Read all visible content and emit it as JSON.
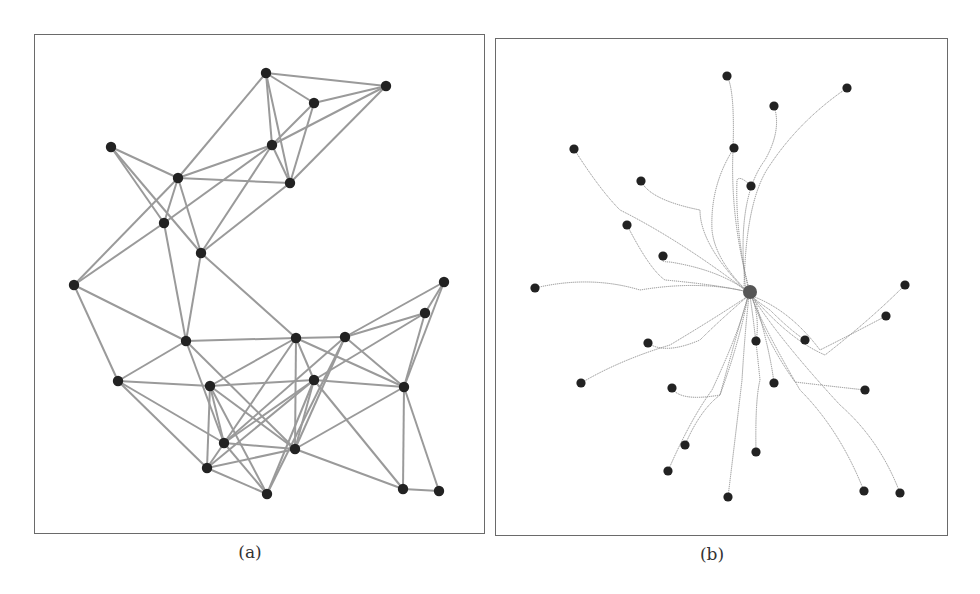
{
  "figure": {
    "panels": [
      {
        "id": "a",
        "caption": "(a)",
        "style": {
          "edge_color": "#9a9a9a",
          "edge_width": 2,
          "node_color": "#222222",
          "node_radius": 5.2
        },
        "nodes": [
          [
            266,
            73
          ],
          [
            386,
            86
          ],
          [
            314,
            103
          ],
          [
            111,
            147
          ],
          [
            272,
            145
          ],
          [
            178,
            178
          ],
          [
            290,
            183
          ],
          [
            164,
            223
          ],
          [
            201,
            253
          ],
          [
            74,
            285
          ],
          [
            444,
            282
          ],
          [
            425,
            313
          ],
          [
            186,
            341
          ],
          [
            296,
            338
          ],
          [
            345,
            337
          ],
          [
            118,
            381
          ],
          [
            210,
            386
          ],
          [
            314,
            380
          ],
          [
            404,
            387
          ],
          [
            224,
            443
          ],
          [
            295,
            449
          ],
          [
            207,
            468
          ],
          [
            267,
            494
          ],
          [
            403,
            489
          ],
          [
            439,
            491
          ]
        ],
        "edges": [
          [
            0,
            1
          ],
          [
            0,
            2
          ],
          [
            0,
            4
          ],
          [
            0,
            6
          ],
          [
            0,
            5
          ],
          [
            2,
            1
          ],
          [
            2,
            4
          ],
          [
            2,
            6
          ],
          [
            1,
            4
          ],
          [
            1,
            6
          ],
          [
            4,
            6
          ],
          [
            3,
            5
          ],
          [
            3,
            7
          ],
          [
            3,
            8
          ],
          [
            5,
            4
          ],
          [
            5,
            6
          ],
          [
            5,
            7
          ],
          [
            5,
            8
          ],
          [
            5,
            9
          ],
          [
            7,
            4
          ],
          [
            7,
            9
          ],
          [
            7,
            12
          ],
          [
            8,
            4
          ],
          [
            8,
            6
          ],
          [
            8,
            12
          ],
          [
            8,
            13
          ],
          [
            9,
            12
          ],
          [
            9,
            15
          ],
          [
            12,
            15
          ],
          [
            12,
            13
          ],
          [
            12,
            19
          ],
          [
            12,
            20
          ],
          [
            15,
            16
          ],
          [
            15,
            19
          ],
          [
            15,
            21
          ],
          [
            16,
            19
          ],
          [
            16,
            21
          ],
          [
            16,
            22
          ],
          [
            16,
            20
          ],
          [
            16,
            17
          ],
          [
            16,
            13
          ],
          [
            19,
            20
          ],
          [
            19,
            17
          ],
          [
            19,
            22
          ],
          [
            19,
            14
          ],
          [
            21,
            17
          ],
          [
            21,
            20
          ],
          [
            21,
            22
          ],
          [
            21,
            13
          ],
          [
            22,
            17
          ],
          [
            22,
            14
          ],
          [
            13,
            14
          ],
          [
            13,
            17
          ],
          [
            13,
            18
          ],
          [
            13,
            20
          ],
          [
            14,
            10
          ],
          [
            14,
            11
          ],
          [
            14,
            18
          ],
          [
            14,
            20
          ],
          [
            17,
            11
          ],
          [
            17,
            18
          ],
          [
            17,
            23
          ],
          [
            17,
            20
          ],
          [
            18,
            10
          ],
          [
            18,
            11
          ],
          [
            18,
            20
          ],
          [
            18,
            23
          ],
          [
            18,
            24
          ],
          [
            11,
            10
          ],
          [
            20,
            23
          ],
          [
            23,
            24
          ]
        ]
      },
      {
        "id": "b",
        "caption": "(b)",
        "style": {
          "edge_color": "#8c8c8c",
          "edge_width": 1,
          "edge_dash": "1.2 0.8",
          "node_color": "#222222",
          "node_radius": 4.6,
          "hub_color": "#555555",
          "hub_radius": 7
        },
        "hub": [
          750,
          292
        ],
        "nodes": [
          [
            727,
            76
          ],
          [
            847,
            88
          ],
          [
            774,
            106
          ],
          [
            574,
            149
          ],
          [
            734,
            148
          ],
          [
            641,
            181
          ],
          [
            751,
            186
          ],
          [
            627,
            225
          ],
          [
            663,
            256
          ],
          [
            535,
            288
          ],
          [
            905,
            285
          ],
          [
            886,
            316
          ],
          [
            648,
            343
          ],
          [
            756,
            341
          ],
          [
            805,
            340
          ],
          [
            581,
            383
          ],
          [
            672,
            388
          ],
          [
            774,
            383
          ],
          [
            865,
            390
          ],
          [
            685,
            445
          ],
          [
            756,
            452
          ],
          [
            668,
            471
          ],
          [
            728,
            497
          ],
          [
            864,
            491
          ],
          [
            900,
            493
          ]
        ],
        "paths": [
          "M727,76 Q735,90 733,150 Q730,220 750,292",
          "M847,88 Q800,120 770,165 Q745,200 744,292",
          "M774,106 Q782,130 765,160 Q735,200 746,292",
          "M574,149 Q600,190 620,210 Q680,240 748,292",
          "M734,148 Q710,185 712,230 Q715,260 748,292",
          "M641,181 Q650,200 700,210 Q700,245 747,292",
          "M751,186 Q740,175 737,180 Q735,230 749,292",
          "M627,225 Q650,270 665,280 Q720,285 748,292",
          "M663,256 Q658,262 670,262 Q720,270 748,292",
          "M535,288 Q590,275 640,290 Q700,280 748,292",
          "M905,285 Q870,320 825,355 Q790,340 752,296",
          "M886,316 Q850,335 820,350 Q790,310 752,296",
          "M648,343 Q665,355 700,340 Q720,320 748,296",
          "M756,341 Q760,320 752,296",
          "M805,340 Q790,330 770,310 Q755,300 752,296",
          "M581,383 Q620,360 670,345 Q720,315 748,296",
          "M672,388 Q680,402 720,395 Q735,340 748,296",
          "M774,383 Q770,350 755,300",
          "M865,390 Q820,385 795,382 Q765,340 752,296",
          "M685,445 Q700,410 720,395 Q740,340 748,296",
          "M756,452 Q755,400 760,380 Q755,330 750,296",
          "M668,471 Q690,420 712,390 Q740,330 748,296",
          "M728,497 Q735,440 742,380 Q745,330 749,296",
          "M864,491 Q840,430 800,390 Q765,330 751,296",
          "M900,493 Q880,440 840,405 Q780,340 752,296"
        ]
      }
    ]
  }
}
